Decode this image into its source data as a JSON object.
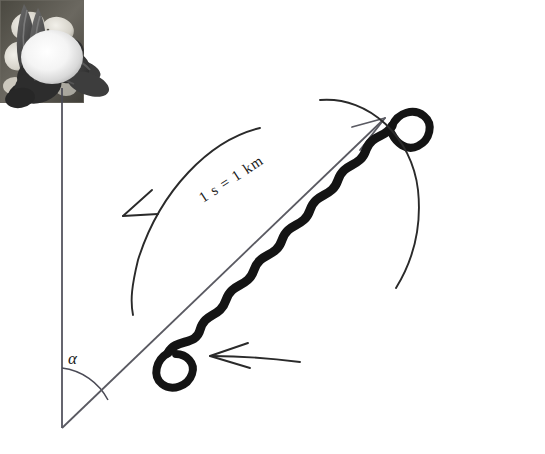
{
  "figure": {
    "background_color": "#ffffff",
    "width": 545,
    "height": 454
  },
  "labels": {
    "angle_symbol": "α",
    "distance_code": "1 s = 1 km"
  },
  "elements": {
    "sun": {
      "name": "sun-symbol",
      "shape": "sphere",
      "center_x": 52,
      "center_y": 57,
      "radius_x": 31,
      "radius_y": 27,
      "fill_center": "#ffffff",
      "fill_edge": "#c9c9c9"
    },
    "sun_line": {
      "name": "sun-reference-line",
      "x1": 62,
      "y1": 88,
      "x2": 62,
      "y2": 428,
      "color": "#4a4a55"
    },
    "direction_line": {
      "name": "flight-direction-line",
      "x1": 62,
      "y1": 428,
      "x2": 385,
      "y2": 118,
      "color": "#5a5a62"
    },
    "angle_arc": {
      "name": "angle-arc",
      "vertex_x": 62,
      "vertex_y": 428,
      "radius": 60,
      "color": "#4a4a55"
    },
    "waggle_run": {
      "name": "waggle-run-path",
      "color": "#111111",
      "stroke_width": 9,
      "description": "thick zigzag waggle run along the flight direction axis"
    },
    "return_loop_left": {
      "name": "return-loop-left",
      "color": "#2a2a2a",
      "arrow_direction": "down-left"
    },
    "return_loop_right": {
      "name": "return-loop-right",
      "color": "#2a2a2a",
      "arrow_direction": "down-right"
    },
    "return_loop_bottom": {
      "name": "return-loop-bottom",
      "color": "#2a2a2a",
      "arrow_direction": "left"
    },
    "direction_arrowhead": {
      "name": "direction-arrowhead",
      "tip_x": 385,
      "tip_y": 118,
      "color": "#5a5a62"
    }
  },
  "photos": {
    "flower": {
      "name": "flower-photo",
      "caption": "flower blossom",
      "tone_light": "#e8e6e0",
      "tone_mid": "#9c9a92",
      "tone_dark": "#3d3b36"
    },
    "bee_upper": {
      "name": "bee-photo-upper",
      "caption": "dancing honeybee",
      "tone_dark": "#3a3a3a",
      "tone_mid": "#6e6e6e"
    },
    "bee_lower": {
      "name": "bee-photo-lower",
      "caption": "dancing honeybee",
      "tone_dark": "#3a3a3a",
      "tone_mid": "#6e6e6e"
    }
  }
}
